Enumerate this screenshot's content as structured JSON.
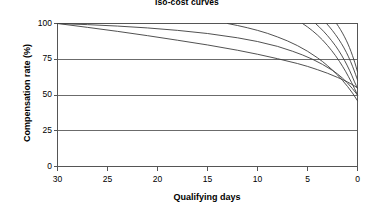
{
  "chart_data": {
    "type": "line",
    "title": "Iso-cost curves",
    "xlabel": "Qualifying days",
    "ylabel": "Compensation rate (%)",
    "xlim": [
      30,
      0
    ],
    "ylim": [
      0,
      100
    ],
    "x_reversed": true,
    "xticks": [
      30,
      25,
      20,
      15,
      10,
      5,
      0
    ],
    "xtick_labels": [
      "30",
      "25",
      "20",
      "15",
      "10",
      "5",
      "0"
    ],
    "yticks": [
      0,
      25,
      50,
      75,
      100
    ],
    "ytick_labels": [
      "0",
      "25",
      "50",
      "75",
      "100"
    ],
    "grid": "horizontal",
    "gridlines_y": [
      25,
      50,
      75
    ],
    "legend": "none",
    "line_color": "#3d3d3d",
    "axis_color": "#555555",
    "grid_color": "#6b6b6b",
    "background": "#ffffff",
    "series": [
      {
        "name": "iso-cost-1",
        "x": [
          30,
          27,
          24,
          21,
          18,
          15,
          12,
          10,
          8,
          6,
          5,
          4,
          3,
          2,
          1.5,
          1,
          0.5,
          0
        ],
        "values": [
          100,
          97.3,
          94.5,
          91.5,
          88.3,
          85,
          81.3,
          78.5,
          75.4,
          72,
          70,
          67.7,
          65.2,
          62.3,
          60.8,
          59.1,
          57.2,
          55
        ]
      },
      {
        "name": "iso-cost-2",
        "x": [
          30,
          27,
          24,
          21,
          18,
          15,
          12,
          10,
          8,
          6.5,
          5.5,
          4.5,
          3.5,
          2.5,
          2,
          1.5,
          1,
          0.5,
          0
        ],
        "values": [
          100,
          99.2,
          98.2,
          96.9,
          95.2,
          93,
          90,
          87.4,
          84,
          80.6,
          78,
          75,
          71.4,
          67.2,
          64.7,
          61.8,
          58.4,
          54.4,
          50
        ]
      },
      {
        "name": "iso-cost-3",
        "x": [
          13,
          12,
          11,
          10,
          9,
          8,
          7,
          6,
          5,
          4,
          3.5,
          3,
          2.5,
          2,
          1.5,
          1,
          0.5,
          0
        ],
        "values": [
          100,
          98.6,
          97,
          95.2,
          93.1,
          90.6,
          87.8,
          84.5,
          80.6,
          76,
          73.4,
          70.5,
          67.4,
          64,
          60.2,
          56,
          51.3,
          46
        ]
      },
      {
        "name": "iso-cost-4",
        "x": [
          5.5,
          5,
          4.5,
          4,
          3.5,
          3,
          2.6,
          2.2,
          1.8,
          1.5,
          1.2,
          0.9,
          0.6,
          0.3,
          0
        ],
        "values": [
          100,
          97.6,
          94.9,
          91.9,
          88.5,
          84.6,
          81.2,
          77.5,
          73.4,
          70.1,
          66.6,
          62.8,
          58.8,
          54.5,
          50
        ]
      },
      {
        "name": "iso-cost-5",
        "x": [
          4.2,
          3.8,
          3.4,
          3,
          2.6,
          2.2,
          1.9,
          1.6,
          1.3,
          1.05,
          0.8,
          0.55,
          0.3,
          0.15,
          0
        ],
        "values": [
          100,
          97.4,
          94.6,
          91.5,
          88.1,
          84.4,
          81.3,
          77.9,
          74.2,
          70.9,
          67.3,
          63.4,
          59.2,
          56.9,
          54.5
        ]
      },
      {
        "name": "iso-cost-6",
        "x": [
          3.1,
          2.8,
          2.5,
          2.2,
          1.9,
          1.6,
          1.35,
          1.1,
          0.9,
          0.7,
          0.5,
          0.35,
          0.2,
          0.1,
          0
        ],
        "values": [
          100,
          97.6,
          95,
          92.2,
          89.2,
          85.9,
          82.9,
          79.6,
          76.7,
          73.5,
          70.1,
          67.4,
          64.5,
          62.5,
          60.5
        ]
      },
      {
        "name": "iso-cost-7",
        "x": [
          2.1,
          1.9,
          1.7,
          1.5,
          1.3,
          1.1,
          0.95,
          0.8,
          0.65,
          0.5,
          0.38,
          0.26,
          0.16,
          0.08,
          0
        ],
        "values": [
          100,
          97.9,
          95.7,
          93.3,
          90.7,
          87.9,
          85.6,
          83.1,
          80.4,
          77.5,
          75.1,
          72.5,
          70.2,
          68.1,
          66.3
        ]
      }
    ]
  }
}
